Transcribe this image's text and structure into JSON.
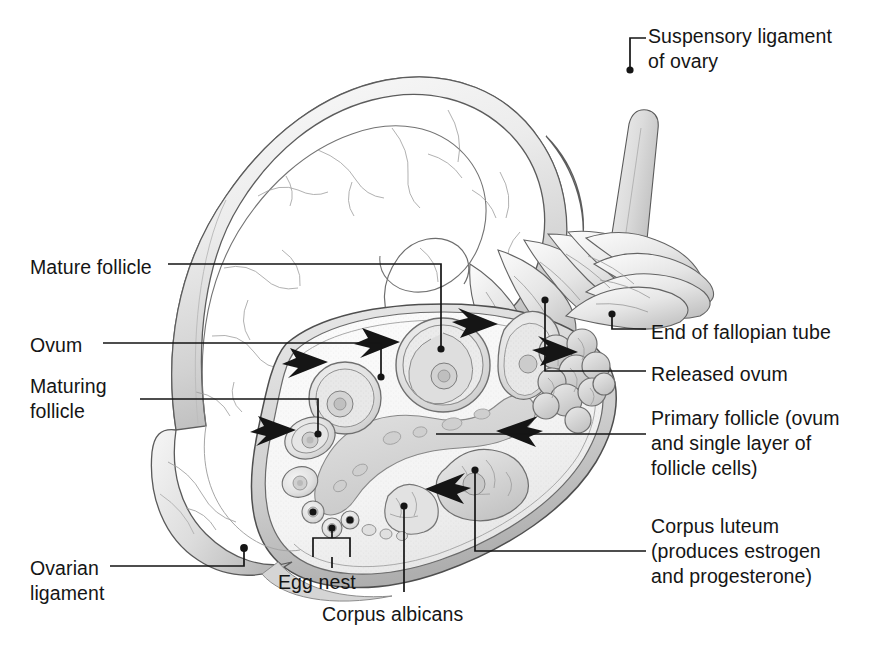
{
  "figure": {
    "kind": "anatomical-illustration",
    "background_color": "#ffffff",
    "ink_color": "#151515",
    "tissue_light": "#f2f2f2",
    "tissue_mid": "#d8d8d8",
    "tissue_dark": "#a8a8a8"
  },
  "labels": {
    "suspensory_ligament": "Suspensory ligament\nof ovary",
    "mature_follicle": "Mature follicle",
    "ovum": "Ovum",
    "maturing_follicle": "Maturing\nfollicle",
    "ovarian_ligament": "Ovarian\nligament",
    "egg_nest": "Egg nest",
    "corpus_albicans": "Corpus albicans",
    "end_of_fallopian_tube": "End of fallopian tube",
    "released_ovum": "Released ovum",
    "primary_follicle": "Primary follicle (ovum\nand single layer of\nfollicle cells)",
    "corpus_luteum": "Corpus luteum\n(produces estrogen\nand progesterone)"
  },
  "label_positions": {
    "suspensory_ligament": {
      "x": 648,
      "y": 24
    },
    "mature_follicle": {
      "x": 30,
      "y": 255
    },
    "ovum": {
      "x": 30,
      "y": 333
    },
    "maturing_follicle": {
      "x": 30,
      "y": 374
    },
    "ovarian_ligament": {
      "x": 30,
      "y": 556
    },
    "egg_nest": {
      "x": 278,
      "y": 570
    },
    "corpus_albicans": {
      "x": 322,
      "y": 602
    },
    "end_of_fallopian_tube": {
      "x": 651,
      "y": 320
    },
    "released_ovum": {
      "x": 651,
      "y": 362
    },
    "primary_follicle": {
      "x": 651,
      "y": 406
    },
    "corpus_luteum": {
      "x": 651,
      "y": 514
    },
    "font_size_px": 19.5,
    "line_height_px": 25
  },
  "leader_lines": {
    "stroke": "#151515",
    "width": 1.7,
    "dot_radius": 3.6,
    "paths": [
      {
        "name": "suspensory-ligament-leader",
        "d": "M 643 66 L 643 36 L 643 36",
        "elbow": true
      },
      {
        "name": "suspensory-ligament-stem",
        "d": "M 643 66 L 643 36"
      },
      {
        "name": "mature-follicle-leader",
        "d": "M 157 264 L 441 264 L 441 349",
        "dot": [
          441,
          349
        ]
      },
      {
        "name": "ovum-leader",
        "d": "M 103 343 L 381 343 L 381 377",
        "dot": [
          381,
          377
        ]
      },
      {
        "name": "maturing-follicle-leader",
        "d": "M 136 399 L 318 399 L 318 434",
        "dot": [
          318,
          434
        ]
      },
      {
        "name": "ovarian-ligament-leader",
        "d": "M 105 566 L 244 566 L 244 546",
        "dot": [
          244,
          546
        ]
      },
      {
        "name": "egg-nest-leader",
        "d": "M 313 560 L 313 537 L 349 537 L 349 560",
        "bracket": true
      },
      {
        "name": "corpus-albicans-leader",
        "d": "M 404 594 L 404 504",
        "dot": [
          404,
          504
        ]
      },
      {
        "name": "end-of-fallopian-tube-leader",
        "d": "M 646 329 L 611 329 L 611 312",
        "dot": [
          611,
          312
        ]
      },
      {
        "name": "released-ovum-leader",
        "d": "M 646 371 L 544 371 L 544 298",
        "dot": [
          544,
          298
        ]
      },
      {
        "name": "primary-follicle-leader",
        "d": "M 646 434 L 435 434",
        "dot": null
      },
      {
        "name": "corpus-luteum-leader",
        "d": "M 646 551 L 474 551 L 474 468",
        "dot": [
          474,
          468
        ]
      }
    ]
  },
  "arrows": {
    "fill": "#151515",
    "count": 7,
    "markers": [
      {
        "name": "arrow-to-maturing-follicle",
        "tip_x": 328,
        "tip_y": 362,
        "angle": -28
      },
      {
        "name": "arrow-to-primary-follicle-left",
        "tip_x": 296,
        "tip_y": 430,
        "angle": -26
      },
      {
        "name": "arrow-to-mature-follicle",
        "tip_x": 400,
        "tip_y": 342,
        "angle": -25
      },
      {
        "name": "arrow-to-released-ovum-top",
        "tip_x": 498,
        "tip_y": 324,
        "angle": 18
      },
      {
        "name": "arrow-to-released-ovum-right",
        "tip_x": 578,
        "tip_y": 352,
        "angle": 20
      },
      {
        "name": "arrow-to-corpus-luteum-forming",
        "tip_x": 496,
        "tip_y": 431,
        "angle": 28
      },
      {
        "name": "arrow-to-corpus-albicans",
        "tip_x": 425,
        "tip_y": 489,
        "angle": 30
      }
    ]
  },
  "structures": [
    {
      "name": "fallopian-tube",
      "description": "Large arching tube across top of figure with fine vascular markings"
    },
    {
      "name": "fimbriae",
      "description": "Finger-like projections at the end of the fallopian tube"
    },
    {
      "name": "suspensory-ligament-of-ovary",
      "description": "Narrow band extending upper right"
    },
    {
      "name": "ovarian-ligament",
      "description": "Broad band at lower left of ovary"
    },
    {
      "name": "ovary-cortex",
      "description": "Oval sectioned body containing follicles"
    },
    {
      "name": "mature-follicle",
      "description": "Large round follicle with antrum and ovum"
    },
    {
      "name": "maturing-follicle",
      "description": "Medium follicle left of the mature follicle"
    },
    {
      "name": "primary-follicles",
      "description": "Small follicles with single layer of cells"
    },
    {
      "name": "corpus-luteum",
      "description": "Lobulated mass at right of ovary"
    },
    {
      "name": "corpus-albicans",
      "description": "Small scarred body at lower ovary"
    },
    {
      "name": "egg-nest",
      "description": "Cluster of three primordial follicles at lower ovary"
    },
    {
      "name": "released-ovum",
      "description": "Ovum at fimbriated end of tube"
    }
  ]
}
